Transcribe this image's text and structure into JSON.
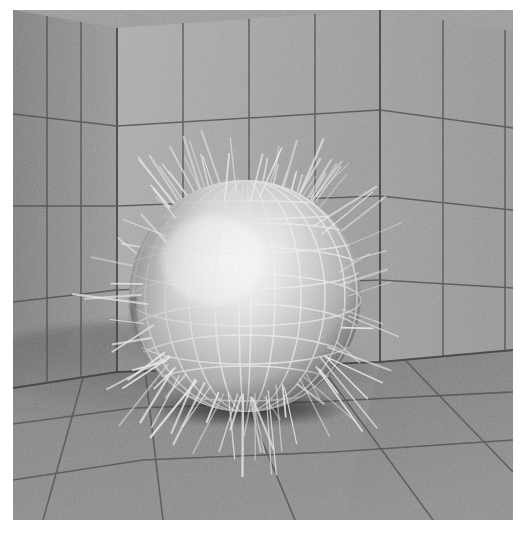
{
  "scene": {
    "title": "Hairy sphere in a corner room",
    "description": "Ray-traced grey-scale render of a wireframe-textured sphere with radiating hair strands resting on a gridded floor inside a two-wall corner.",
    "render_frame": {
      "x": 13,
      "y": 10,
      "width": 500,
      "height": 510
    },
    "canvas": {
      "width": 524,
      "height": 541,
      "background": "#ffffff"
    }
  },
  "palette": {
    "page_background": "#ffffff",
    "left_wall": "#8d8d8d",
    "back_wall": "#a6a6a6",
    "right_wall": "#9a9a9a",
    "floor": "#8a8a8a",
    "floor_far": "#7e7e7e",
    "grid_line": "#4a4a4a",
    "sphere_base": "#b5b5b5",
    "sphere_highlight": "#f2f2f2",
    "sphere_shadow": "#5f5f5f",
    "sphere_rim_dark": "#4f4f4f",
    "wireframe": "#e8e8e8",
    "hair": "#e6e6e6",
    "contact_shadow": "#2a2a2a"
  },
  "geometry": {
    "corner_edge_x": 104,
    "right_corner_x": 367,
    "floor_line_left_y": 366,
    "floor_line_corner_y": 362,
    "floor_line_right_y": 358,
    "sphere": {
      "center_x": 232,
      "center_y": 286,
      "radius": 116,
      "highlight_x": 196,
      "highlight_y": 244,
      "wire_meridians": 12,
      "wire_parallels": 7
    },
    "hair": {
      "count": 54,
      "min_length": 14,
      "max_length": 58,
      "thickness": 1.6
    }
  },
  "wall_grid": {
    "left_wall_columns": 3,
    "left_wall_rows": 4,
    "back_wall_columns": 4,
    "back_wall_rows": 4,
    "right_wall_columns": 3,
    "right_wall_rows": 4
  },
  "floor_grid": {
    "depth_lines": 4,
    "radial_lines": 7
  },
  "chart_data": {
    "type": "scatter",
    "xlabel": "",
    "ylabel": "",
    "categories": [
      "left wall",
      "back wall",
      "right wall",
      "floor",
      "sphere",
      "hair strands"
    ],
    "values": [
      1,
      1,
      1,
      1,
      1,
      54
    ]
  }
}
